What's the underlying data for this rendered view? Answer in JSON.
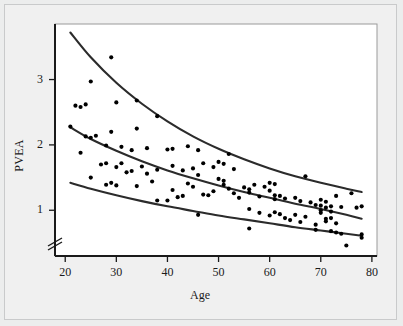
{
  "chart_data": {
    "type": "scatter",
    "title": "",
    "xlabel": "Age",
    "ylabel": "PVEA",
    "xlim": [
      18,
      81
    ],
    "ylim": [
      0.3,
      3.85
    ],
    "xticks": [
      20,
      30,
      40,
      50,
      60,
      70,
      80
    ],
    "xtick_labels": [
      "20",
      "30",
      "40",
      "50",
      "60",
      "70",
      "80"
    ],
    "yticks": [
      1,
      2,
      3
    ],
    "ytick_labels": [
      "1",
      "2",
      "3"
    ],
    "grid": false,
    "legend": null,
    "axis_break": {
      "axis": "y",
      "position": 0.62,
      "symbol": "double-slash"
    },
    "marker": {
      "shape": "circle",
      "color": "#000000",
      "size": 3
    },
    "curves": [
      {
        "name": "upper-percentile-curve",
        "color": "#2b2b2b",
        "points": [
          [
            21,
            3.72
          ],
          [
            25,
            3.34
          ],
          [
            30,
            2.95
          ],
          [
            35,
            2.63
          ],
          [
            40,
            2.36
          ],
          [
            45,
            2.13
          ],
          [
            50,
            1.94
          ],
          [
            55,
            1.78
          ],
          [
            60,
            1.64
          ],
          [
            65,
            1.52
          ],
          [
            70,
            1.42
          ],
          [
            75,
            1.33
          ],
          [
            78,
            1.28
          ]
        ]
      },
      {
        "name": "median-curve",
        "color": "#2b2b2b",
        "points": [
          [
            21,
            2.27
          ],
          [
            25,
            2.09
          ],
          [
            30,
            1.91
          ],
          [
            35,
            1.75
          ],
          [
            40,
            1.61
          ],
          [
            45,
            1.49
          ],
          [
            50,
            1.38
          ],
          [
            55,
            1.28
          ],
          [
            60,
            1.19
          ],
          [
            65,
            1.1
          ],
          [
            70,
            1.02
          ],
          [
            75,
            0.93
          ],
          [
            78,
            0.87
          ]
        ]
      },
      {
        "name": "lower-percentile-curve",
        "color": "#2b2b2b",
        "points": [
          [
            21,
            1.42
          ],
          [
            25,
            1.33
          ],
          [
            30,
            1.23
          ],
          [
            35,
            1.14
          ],
          [
            40,
            1.06
          ],
          [
            45,
            0.99
          ],
          [
            50,
            0.92
          ],
          [
            55,
            0.86
          ],
          [
            60,
            0.8
          ],
          [
            65,
            0.74
          ],
          [
            70,
            0.69
          ],
          [
            75,
            0.64
          ],
          [
            78,
            0.61
          ]
        ]
      }
    ],
    "points": [
      [
        29,
        3.34
      ],
      [
        25,
        2.97
      ],
      [
        24,
        2.62
      ],
      [
        23,
        2.58
      ],
      [
        30,
        2.65
      ],
      [
        34,
        2.68
      ],
      [
        38,
        2.44
      ],
      [
        21,
        2.28
      ],
      [
        24,
        2.13
      ],
      [
        25,
        2.11
      ],
      [
        29,
        2.2
      ],
      [
        34,
        2.25
      ],
      [
        23,
        1.88
      ],
      [
        28,
        1.99
      ],
      [
        31,
        1.97
      ],
      [
        36,
        1.95
      ],
      [
        33,
        1.92
      ],
      [
        41,
        1.94
      ],
      [
        40,
        1.93
      ],
      [
        44,
        1.98
      ],
      [
        46,
        1.92
      ],
      [
        52,
        1.86
      ],
      [
        27,
        1.7
      ],
      [
        28,
        1.72
      ],
      [
        30,
        1.66
      ],
      [
        31,
        1.72
      ],
      [
        33,
        1.6
      ],
      [
        35,
        1.67
      ],
      [
        38,
        1.62
      ],
      [
        41,
        1.68
      ],
      [
        43,
        1.61
      ],
      [
        45,
        1.64
      ],
      [
        47,
        1.72
      ],
      [
        49,
        1.66
      ],
      [
        50,
        1.74
      ],
      [
        51,
        1.71
      ],
      [
        53,
        1.63
      ],
      [
        25,
        1.5
      ],
      [
        29,
        1.42
      ],
      [
        28,
        1.39
      ],
      [
        30,
        1.38
      ],
      [
        34,
        1.37
      ],
      [
        36,
        1.56
      ],
      [
        38,
        1.15
      ],
      [
        40,
        1.15
      ],
      [
        41,
        1.31
      ],
      [
        43,
        1.22
      ],
      [
        44,
        1.41
      ],
      [
        45,
        1.36
      ],
      [
        46,
        1.54
      ],
      [
        46,
        0.93
      ],
      [
        47,
        1.24
      ],
      [
        48,
        1.23
      ],
      [
        49,
        1.29
      ],
      [
        50,
        1.48
      ],
      [
        51,
        1.45
      ],
      [
        51,
        1.39
      ],
      [
        52,
        1.33
      ],
      [
        53,
        1.26
      ],
      [
        55,
        1.35
      ],
      [
        56,
        1.32
      ],
      [
        56,
        1.27
      ],
      [
        56,
        1.02
      ],
      [
        56,
        0.72
      ],
      [
        57,
        1.39
      ],
      [
        58,
        1.21
      ],
      [
        59,
        1.36
      ],
      [
        60,
        1.3
      ],
      [
        60,
        1.42
      ],
      [
        61,
        1.4
      ],
      [
        61,
        1.23
      ],
      [
        61,
        1.17
      ],
      [
        61,
        0.97
      ],
      [
        60,
        0.92
      ],
      [
        62,
        0.94
      ],
      [
        63,
        1.18
      ],
      [
        63,
        0.88
      ],
      [
        64,
        0.85
      ],
      [
        65,
        1.19
      ],
      [
        65,
        0.93
      ],
      [
        66,
        1.14
      ],
      [
        66,
        0.82
      ],
      [
        67,
        1.52
      ],
      [
        68,
        1.12
      ],
      [
        69,
        1.08
      ],
      [
        69,
        0.78
      ],
      [
        69,
        0.7
      ],
      [
        70,
        1.16
      ],
      [
        70,
        1.07
      ],
      [
        70,
        1.0
      ],
      [
        70,
        0.96
      ],
      [
        71,
        1.13
      ],
      [
        71,
        1.04
      ],
      [
        71,
        0.87
      ],
      [
        71,
        0.83
      ],
      [
        72,
        1.06
      ],
      [
        72,
        0.98
      ],
      [
        72,
        0.68
      ],
      [
        73,
        1.22
      ],
      [
        73,
        0.8
      ],
      [
        73,
        0.66
      ],
      [
        74,
        1.05
      ],
      [
        74,
        0.64
      ],
      [
        75,
        0.46
      ],
      [
        76,
        1.26
      ],
      [
        77,
        1.04
      ],
      [
        78,
        1.06
      ],
      [
        78,
        0.63
      ],
      [
        78,
        0.58
      ],
      [
        22,
        2.6
      ],
      [
        26,
        2.14
      ],
      [
        32,
        1.58
      ],
      [
        37,
        1.44
      ],
      [
        42,
        1.2
      ],
      [
        54,
        1.19
      ],
      [
        58,
        0.96
      ],
      [
        62,
        1.22
      ],
      [
        67,
        0.9
      ],
      [
        72,
        0.88
      ]
    ]
  }
}
